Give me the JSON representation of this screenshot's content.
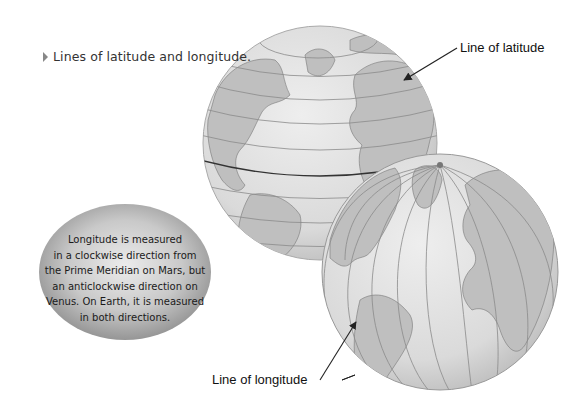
{
  "caption": {
    "text": "Lines of latitude and longitude.",
    "bullet_icon": "triangle-right"
  },
  "labels": {
    "latitude": "Line of latitude",
    "longitude": "Line of longitude"
  },
  "info_bubble": {
    "lines": [
      "Longitude is measured",
      "in a clockwise direction from",
      "the Prime Meridian on Mars, but",
      "an anticlockwise direction on",
      "Venus. On Earth, it is measured",
      "in both directions."
    ]
  },
  "globes": [
    {
      "name": "globe-latitude",
      "shows": "parallels (lines of latitude)"
    },
    {
      "name": "globe-longitude",
      "shows": "meridians (lines of longitude)"
    }
  ],
  "colors": {
    "ocean": "#dcdcdc",
    "land": "#bdbdbd",
    "grid_line": "#8a8a8a",
    "bubble_light": "#e6e6e6",
    "bubble_dark": "#8c8c8c",
    "arrow": "#222222"
  }
}
